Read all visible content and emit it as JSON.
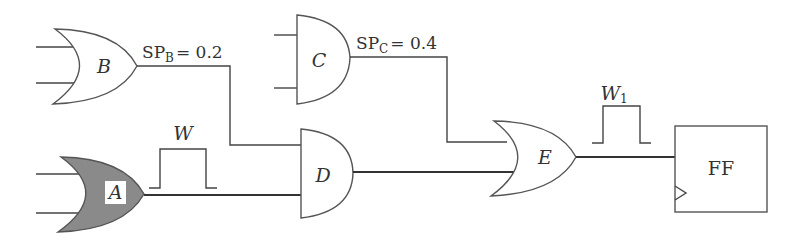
{
  "diagram": {
    "type": "logic-circuit",
    "colors": {
      "stroke": "#444444",
      "shaded_gate_fill": "#8a8a8a",
      "background": "#ffffff"
    },
    "gates": {
      "A": {
        "label": "A",
        "kind": "OR",
        "shaded": true
      },
      "B": {
        "label": "B",
        "kind": "OR",
        "shaded": false
      },
      "C": {
        "label": "C",
        "kind": "AND",
        "shaded": false
      },
      "D": {
        "label": "D",
        "kind": "AND",
        "shaded": false
      },
      "E": {
        "label": "E",
        "kind": "OR",
        "shaded": false
      }
    },
    "flipflop": {
      "label": "FF"
    },
    "annotations": {
      "sp_b": {
        "prefix": "SP",
        "subscript": "B",
        "value": "= 0.2"
      },
      "sp_c": {
        "prefix": "SP",
        "subscript": "C",
        "value": "= 0.4"
      },
      "pulse_w": {
        "label": "W"
      },
      "pulse_w1": {
        "label": "W",
        "subscript": "1"
      }
    },
    "connections": [
      {
        "from": "B",
        "to": "D",
        "input": 1
      },
      {
        "from": "A",
        "to": "D",
        "input": 2
      },
      {
        "from": "C",
        "to": "E",
        "input": 1
      },
      {
        "from": "D",
        "to": "E",
        "input": 2
      },
      {
        "from": "E",
        "to": "FF",
        "input": "D"
      }
    ]
  }
}
